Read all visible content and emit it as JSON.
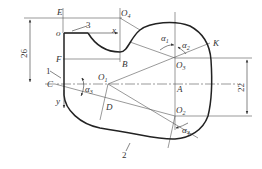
{
  "points": {
    "E": "E",
    "o": "o",
    "F": "F",
    "C": "C",
    "B": "B",
    "A": "A",
    "D": "D",
    "K": "K",
    "O1": "O",
    "O1_sub": "1",
    "O2": "O",
    "O2_sub": "2",
    "O3": "O",
    "O3_sub": "3",
    "O4": "O",
    "O4_sub": "4"
  },
  "axes": {
    "x": "x",
    "y": "y"
  },
  "angles": {
    "a1": "α",
    "a1_sub": "1",
    "a2": "α",
    "a2_sub": "2",
    "a3": "α",
    "a3_sub": "3",
    "a4": "α",
    "a4_sub": "4"
  },
  "callouts": {
    "c1": "1",
    "c2": "2",
    "c3": "3"
  },
  "dimensions": {
    "left": "26",
    "right": "22"
  },
  "colors": {
    "line": "#333333",
    "thin": "#555555"
  }
}
